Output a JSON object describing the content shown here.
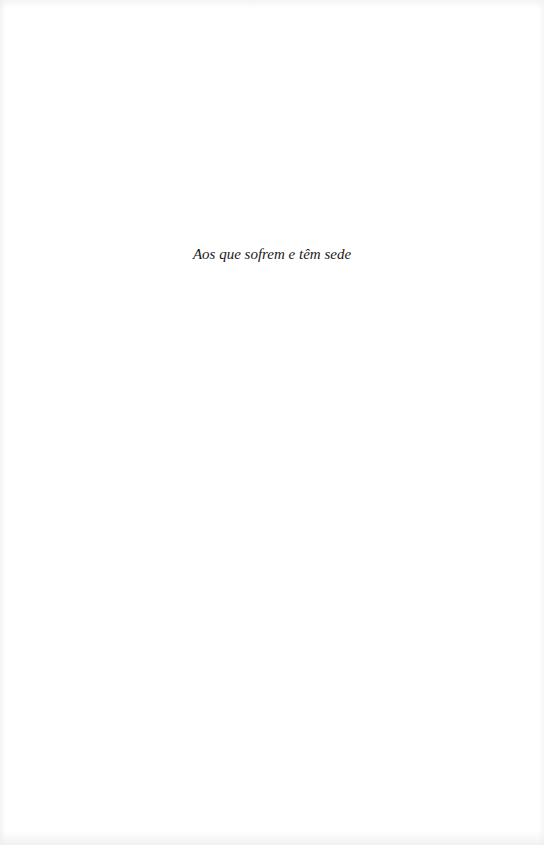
{
  "page": {
    "dedication": "Aos que sofrem e têm sede"
  },
  "colors": {
    "background": "#ffffff",
    "text": "#1a1a1a"
  }
}
